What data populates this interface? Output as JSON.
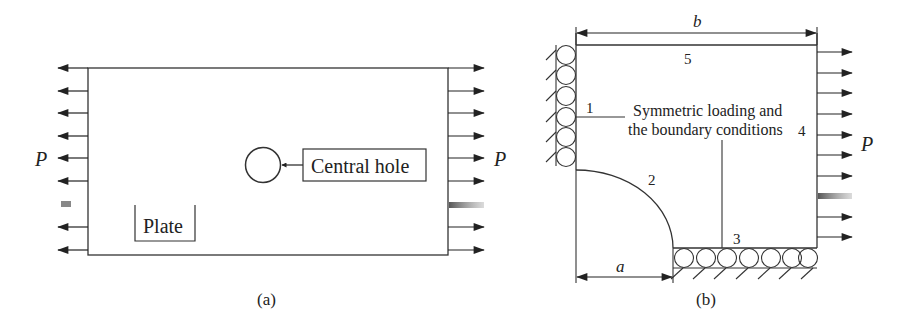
{
  "figure_a": {
    "caption": "(a)",
    "load_label_left": "P",
    "load_label_right": "P",
    "hole_label": "Central hole",
    "plate_label": "Plate",
    "arrow_rows_y": [
      68,
      91,
      113,
      136,
      158,
      181,
      204,
      227,
      250
    ],
    "faded_arrow_index": 6
  },
  "figure_b": {
    "caption": "(b)",
    "dim_width_label": "b",
    "dim_radius_label": "a",
    "edge_labels": {
      "edge1": "1",
      "edge2": "2",
      "edge3": "3",
      "edge4": "4",
      "edge5": "5"
    },
    "load_label": "P",
    "annotation_line1": "Symmetric loading and",
    "annotation_line2": "the boundary conditions",
    "arrow_rows_y": [
      52,
      73,
      93,
      114,
      135,
      155,
      176,
      196,
      217,
      237
    ],
    "faded_arrow_index": 7
  },
  "colors": {
    "line": "#333333",
    "text": "#222222",
    "background": "#ffffff"
  }
}
